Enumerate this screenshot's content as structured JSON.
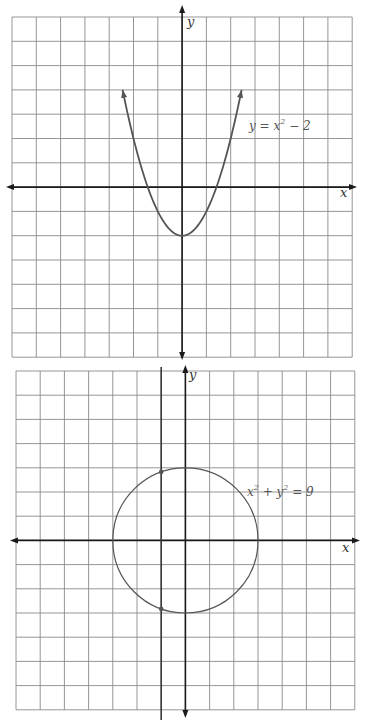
{
  "graphs": [
    {
      "id": "parabola-graph",
      "grid": {
        "cols": 14,
        "rows": 14,
        "x_range": [
          -7,
          7
        ],
        "y_range": [
          -7,
          7
        ],
        "origin_col": 7,
        "origin_row": 7
      },
      "axes": {
        "x_label": "x",
        "y_label": "y"
      },
      "curve": {
        "type": "parabola",
        "a": 1,
        "c": -2,
        "x_domain": [
          -2.45,
          2.45
        ]
      },
      "equation": {
        "lhs": "y = x",
        "exp": "2",
        "rhs": " − 2"
      }
    },
    {
      "id": "circle-graph",
      "grid": {
        "cols": 14,
        "rows": 14,
        "x_range": [
          -7,
          7
        ],
        "y_range": [
          -7,
          7
        ],
        "origin_col": 7,
        "origin_row": 7
      },
      "axes": {
        "x_label": "x",
        "y_label": "y"
      },
      "curve": {
        "type": "circle",
        "radius": 3
      },
      "vertical_line": {
        "x": -1
      },
      "points": [
        {
          "x": -1,
          "y": 2.83
        },
        {
          "x": -1,
          "y": -2.83
        }
      ],
      "equation": {
        "p1": "x",
        "e1": "2",
        "p2": " + y",
        "e2": "2",
        "p3": " = 9"
      }
    }
  ],
  "colors": {
    "grid": "#8a8a8a",
    "axis": "#1a1a1a",
    "curve": "#555555"
  }
}
